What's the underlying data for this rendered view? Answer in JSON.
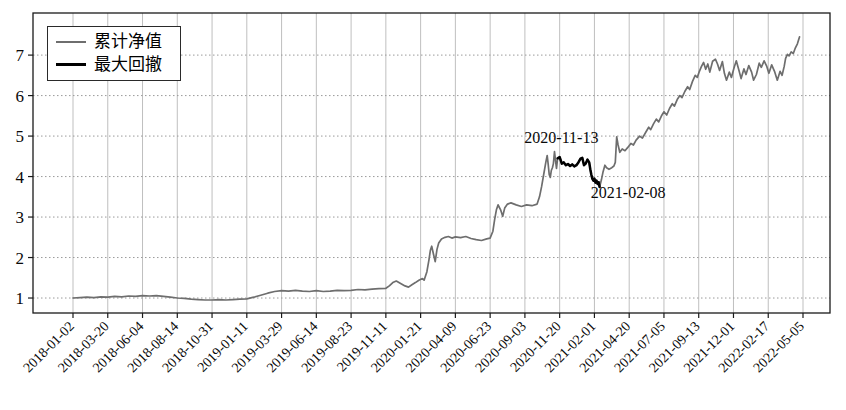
{
  "chart_data": {
    "type": "line",
    "title": "",
    "xlabel": "",
    "ylabel": "",
    "grid": {
      "horizontal": "dotted",
      "vertical": "solid",
      "on": true
    },
    "legend_position": "upper left",
    "y_ticks": [
      1,
      2,
      3,
      4,
      5,
      6,
      7
    ],
    "ylim": [
      0.63,
      8.04
    ],
    "x_tick_labels": [
      "2018-01-02",
      "2018-03-20",
      "2018-06-04",
      "2018-08-14",
      "2018-10-31",
      "2019-01-11",
      "2019-03-29",
      "2019-06-14",
      "2019-08-23",
      "2019-11-11",
      "2020-01-21",
      "2020-04-09",
      "2020-06-23",
      "2020-09-03",
      "2020-11-20",
      "2021-02-01",
      "2021-04-20",
      "2021-07-05",
      "2021-09-13",
      "2021-12-01",
      "2022-02-17",
      "2022-05-05"
    ],
    "annotations": [
      {
        "label": "2020-11-13",
        "t": 14.05,
        "v": 4.95
      },
      {
        "label": "2021-02-08",
        "t": 15.97,
        "v": 3.6
      }
    ],
    "series": [
      {
        "name": "累计净值",
        "color": "#6e6e6e",
        "width": 1.7,
        "points": [
          [
            0,
            1.0
          ],
          [
            0.2,
            1.01
          ],
          [
            0.4,
            1.02
          ],
          [
            0.6,
            1.01
          ],
          [
            0.8,
            1.03
          ],
          [
            1,
            1.02
          ],
          [
            1.2,
            1.04
          ],
          [
            1.4,
            1.03
          ],
          [
            1.6,
            1.05
          ],
          [
            1.8,
            1.04
          ],
          [
            2,
            1.06
          ],
          [
            2.2,
            1.05
          ],
          [
            2.4,
            1.06
          ],
          [
            2.6,
            1.04
          ],
          [
            2.8,
            1.02
          ],
          [
            3,
            1.0
          ],
          [
            3.2,
            0.99
          ],
          [
            3.4,
            0.97
          ],
          [
            3.6,
            0.96
          ],
          [
            3.8,
            0.95
          ],
          [
            4,
            0.95
          ],
          [
            4.2,
            0.96
          ],
          [
            4.4,
            0.95
          ],
          [
            4.6,
            0.96
          ],
          [
            4.8,
            0.97
          ],
          [
            5,
            0.98
          ],
          [
            5.2,
            1.02
          ],
          [
            5.4,
            1.07
          ],
          [
            5.6,
            1.12
          ],
          [
            5.8,
            1.16
          ],
          [
            6,
            1.18
          ],
          [
            6.2,
            1.17
          ],
          [
            6.4,
            1.19
          ],
          [
            6.6,
            1.17
          ],
          [
            6.8,
            1.16
          ],
          [
            7,
            1.18
          ],
          [
            7.2,
            1.16
          ],
          [
            7.4,
            1.17
          ],
          [
            7.6,
            1.19
          ],
          [
            7.8,
            1.18
          ],
          [
            8,
            1.19
          ],
          [
            8.2,
            1.21
          ],
          [
            8.4,
            1.2
          ],
          [
            8.6,
            1.22
          ],
          [
            8.8,
            1.23
          ],
          [
            9,
            1.24
          ],
          [
            9.1,
            1.3
          ],
          [
            9.2,
            1.38
          ],
          [
            9.3,
            1.42
          ],
          [
            9.45,
            1.35
          ],
          [
            9.55,
            1.3
          ],
          [
            9.65,
            1.27
          ],
          [
            9.75,
            1.33
          ],
          [
            9.85,
            1.38
          ],
          [
            9.95,
            1.44
          ],
          [
            10.05,
            1.48
          ],
          [
            10.1,
            1.44
          ],
          [
            10.18,
            1.65
          ],
          [
            10.24,
            1.95
          ],
          [
            10.28,
            2.18
          ],
          [
            10.32,
            2.28
          ],
          [
            10.37,
            2.08
          ],
          [
            10.42,
            1.9
          ],
          [
            10.47,
            2.2
          ],
          [
            10.52,
            2.36
          ],
          [
            10.6,
            2.46
          ],
          [
            10.7,
            2.5
          ],
          [
            10.8,
            2.52
          ],
          [
            10.9,
            2.48
          ],
          [
            11,
            2.51
          ],
          [
            11.15,
            2.49
          ],
          [
            11.3,
            2.52
          ],
          [
            11.45,
            2.47
          ],
          [
            11.6,
            2.44
          ],
          [
            11.75,
            2.42
          ],
          [
            11.9,
            2.46
          ],
          [
            12,
            2.48
          ],
          [
            12.08,
            2.65
          ],
          [
            12.13,
            2.95
          ],
          [
            12.18,
            3.18
          ],
          [
            12.23,
            3.3
          ],
          [
            12.3,
            3.18
          ],
          [
            12.36,
            3.02
          ],
          [
            12.42,
            3.22
          ],
          [
            12.5,
            3.32
          ],
          [
            12.6,
            3.35
          ],
          [
            12.75,
            3.3
          ],
          [
            12.9,
            3.26
          ],
          [
            13.05,
            3.3
          ],
          [
            13.2,
            3.28
          ],
          [
            13.35,
            3.32
          ],
          [
            13.42,
            3.5
          ],
          [
            13.48,
            3.75
          ],
          [
            13.54,
            4.05
          ],
          [
            13.6,
            4.35
          ],
          [
            13.64,
            4.52
          ],
          [
            13.67,
            4.3
          ],
          [
            13.7,
            4.05
          ],
          [
            13.73,
            3.98
          ],
          [
            13.76,
            4.15
          ],
          [
            13.79,
            4.22
          ],
          [
            13.82,
            4.32
          ],
          [
            13.85,
            4.62
          ],
          [
            13.88,
            4.4
          ],
          [
            13.91,
            4.2
          ],
          [
            13.94,
            4.45
          ],
          [
            14,
            4.48
          ],
          [
            14.06,
            4.32
          ],
          [
            14.12,
            4.35
          ],
          [
            14.18,
            4.28
          ],
          [
            14.24,
            4.31
          ],
          [
            14.3,
            4.26
          ],
          [
            14.36,
            4.3
          ],
          [
            14.42,
            4.25
          ],
          [
            14.48,
            4.28
          ],
          [
            14.54,
            4.35
          ],
          [
            14.6,
            4.44
          ],
          [
            14.65,
            4.46
          ],
          [
            14.7,
            4.28
          ],
          [
            14.75,
            4.32
          ],
          [
            14.8,
            4.42
          ],
          [
            14.85,
            4.35
          ],
          [
            14.88,
            4.18
          ],
          [
            14.91,
            4.05
          ],
          [
            14.94,
            3.95
          ],
          [
            14.97,
            3.9
          ],
          [
            15,
            3.95
          ],
          [
            15.03,
            3.85
          ],
          [
            15.06,
            3.9
          ],
          [
            15.09,
            3.82
          ],
          [
            15.12,
            3.86
          ],
          [
            15.15,
            3.74
          ],
          [
            15.2,
            3.92
          ],
          [
            15.25,
            4.12
          ],
          [
            15.3,
            4.28
          ],
          [
            15.35,
            4.22
          ],
          [
            15.42,
            4.18
          ],
          [
            15.5,
            4.22
          ],
          [
            15.56,
            4.26
          ],
          [
            15.6,
            4.35
          ],
          [
            15.64,
            4.98
          ],
          [
            15.68,
            4.78
          ],
          [
            15.73,
            4.6
          ],
          [
            15.8,
            4.68
          ],
          [
            15.88,
            4.64
          ],
          [
            15.96,
            4.72
          ],
          [
            16.05,
            4.82
          ],
          [
            16.12,
            4.78
          ],
          [
            16.2,
            4.9
          ],
          [
            16.3,
            5.0
          ],
          [
            16.38,
            4.95
          ],
          [
            16.48,
            5.1
          ],
          [
            16.56,
            5.22
          ],
          [
            16.62,
            5.16
          ],
          [
            16.7,
            5.3
          ],
          [
            16.78,
            5.42
          ],
          [
            16.85,
            5.35
          ],
          [
            16.93,
            5.5
          ],
          [
            17,
            5.6
          ],
          [
            17.08,
            5.52
          ],
          [
            17.16,
            5.68
          ],
          [
            17.24,
            5.8
          ],
          [
            17.3,
            5.74
          ],
          [
            17.38,
            5.9
          ],
          [
            17.46,
            6.0
          ],
          [
            17.52,
            5.95
          ],
          [
            17.6,
            6.1
          ],
          [
            17.68,
            6.22
          ],
          [
            17.74,
            6.15
          ],
          [
            17.82,
            6.35
          ],
          [
            17.9,
            6.5
          ],
          [
            17.96,
            6.45
          ],
          [
            18.02,
            6.6
          ],
          [
            18.08,
            6.72
          ],
          [
            18.14,
            6.82
          ],
          [
            18.2,
            6.65
          ],
          [
            18.26,
            6.78
          ],
          [
            18.32,
            6.58
          ],
          [
            18.4,
            6.85
          ],
          [
            18.48,
            6.9
          ],
          [
            18.54,
            6.78
          ],
          [
            18.6,
            6.62
          ],
          [
            18.68,
            6.84
          ],
          [
            18.74,
            6.55
          ],
          [
            18.8,
            6.38
          ],
          [
            18.88,
            6.58
          ],
          [
            18.94,
            6.45
          ],
          [
            19.02,
            6.7
          ],
          [
            19.08,
            6.86
          ],
          [
            19.16,
            6.62
          ],
          [
            19.22,
            6.42
          ],
          [
            19.3,
            6.66
          ],
          [
            19.36,
            6.52
          ],
          [
            19.44,
            6.74
          ],
          [
            19.52,
            6.58
          ],
          [
            19.58,
            6.38
          ],
          [
            19.66,
            6.52
          ],
          [
            19.74,
            6.8
          ],
          [
            19.8,
            6.7
          ],
          [
            19.88,
            6.86
          ],
          [
            19.96,
            6.72
          ],
          [
            20.02,
            6.55
          ],
          [
            20.1,
            6.76
          ],
          [
            20.18,
            6.6
          ],
          [
            20.26,
            6.38
          ],
          [
            20.34,
            6.6
          ],
          [
            20.4,
            6.5
          ],
          [
            20.46,
            6.72
          ],
          [
            20.5,
            6.92
          ],
          [
            20.55,
            7.02
          ],
          [
            20.6,
            6.98
          ],
          [
            20.66,
            7.08
          ],
          [
            20.72,
            7.04
          ],
          [
            20.78,
            7.18
          ],
          [
            20.84,
            7.28
          ],
          [
            20.9,
            7.45
          ]
        ]
      },
      {
        "name": "最大回撤",
        "color": "#000000",
        "width": 2.5,
        "points": [
          [
            13.94,
            4.45
          ],
          [
            14,
            4.48
          ],
          [
            14.06,
            4.32
          ],
          [
            14.12,
            4.35
          ],
          [
            14.18,
            4.28
          ],
          [
            14.24,
            4.31
          ],
          [
            14.3,
            4.26
          ],
          [
            14.36,
            4.3
          ],
          [
            14.42,
            4.25
          ],
          [
            14.48,
            4.28
          ],
          [
            14.54,
            4.35
          ],
          [
            14.6,
            4.44
          ],
          [
            14.65,
            4.46
          ],
          [
            14.7,
            4.28
          ],
          [
            14.75,
            4.32
          ],
          [
            14.8,
            4.42
          ],
          [
            14.85,
            4.35
          ],
          [
            14.88,
            4.18
          ],
          [
            14.91,
            4.05
          ],
          [
            14.94,
            3.95
          ],
          [
            14.97,
            3.9
          ],
          [
            15,
            3.95
          ],
          [
            15.03,
            3.85
          ],
          [
            15.06,
            3.9
          ],
          [
            15.09,
            3.82
          ],
          [
            15.12,
            3.86
          ],
          [
            15.15,
            3.74
          ]
        ]
      }
    ]
  }
}
